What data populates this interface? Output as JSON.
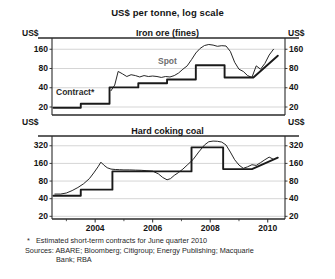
{
  "figure": {
    "title": "US$ per tonne, log scale",
    "unit_label": "US$",
    "footnote_marker": "*",
    "footnote_text": "Estimated short-term contracts for June quarter 2010",
    "sources_label": "Sources:",
    "sources_text": "ABARE; Bloomberg; Citigroup; Energy Publishing; Macquarie",
    "sources_text_cont": "Bank; RBA",
    "line_color": "#1a1a1a",
    "grid_color": "#b9b9b9",
    "frame_color": "#2a2a2a",
    "background": "#ffffff"
  },
  "chart_data": [
    {
      "type": "line",
      "title": "Iron ore (fines)",
      "xlabel": "",
      "ylabel": "US$",
      "yscale": "log",
      "ylim": [
        15,
        240
      ],
      "yticks": [
        20,
        40,
        80,
        160
      ],
      "ytick_labels": [
        "20",
        "40",
        "80",
        "160"
      ],
      "xlim": [
        2002.5,
        2010.6
      ],
      "xticks": [
        2004,
        2006,
        2008,
        2010
      ],
      "xtick_labels": [
        "2004",
        "2006",
        "2008",
        "2010"
      ],
      "xminor": [
        2003,
        2005,
        2007,
        2009
      ],
      "grid": true,
      "legend_position": "in-plot",
      "series": [
        {
          "name": "Contract*",
          "style": "step",
          "width": 1.9,
          "label_x": 2003.25,
          "label_y": 31,
          "x": [
            2002.55,
            2003.5,
            2003.5,
            2004.5,
            2004.5,
            2005.5,
            2005.5,
            2006.5,
            2006.5,
            2007.5,
            2007.5,
            2008.5,
            2008.5,
            2009.5,
            2009.5,
            2010.35
          ],
          "values": [
            19.5,
            19.5,
            22.5,
            22.5,
            40.5,
            40.5,
            47,
            47,
            54,
            54,
            90,
            90,
            58,
            58,
            58,
            127
          ]
        },
        {
          "name": "Spot",
          "style": "line",
          "width": 0.95,
          "label_x": 2006.2,
          "label_y": 108,
          "x": [
            2004.55,
            2004.68,
            2004.8,
            2004.95,
            2005.1,
            2005.25,
            2005.4,
            2005.55,
            2005.7,
            2005.85,
            2006.0,
            2006.15,
            2006.3,
            2006.45,
            2006.6,
            2006.75,
            2006.9,
            2007.05,
            2007.2,
            2007.35,
            2007.5,
            2007.65,
            2007.8,
            2007.95,
            2008.1,
            2008.25,
            2008.4,
            2008.55,
            2008.7,
            2008.85,
            2009.0,
            2009.15,
            2009.3,
            2009.45,
            2009.6,
            2009.75,
            2009.9,
            2010.05,
            2010.2
          ],
          "values": [
            36,
            44,
            72,
            66,
            60,
            64,
            62,
            59,
            62,
            60,
            61,
            60,
            58,
            60,
            59,
            62,
            68,
            78,
            88,
            110,
            140,
            165,
            183,
            190,
            186,
            178,
            182,
            180,
            148,
            100,
            78,
            72,
            62,
            58,
            88,
            78,
            96,
            130,
            160
          ]
        }
      ]
    },
    {
      "type": "line",
      "title": "Hard coking coal",
      "xlabel": "",
      "ylabel": "US$",
      "yscale": "log",
      "ylim": [
        18,
        470
      ],
      "yticks": [
        20,
        40,
        80,
        160,
        320
      ],
      "ytick_labels": [
        "20",
        "40",
        "80",
        "160",
        "320"
      ],
      "xlim": [
        2002.5,
        2010.6
      ],
      "xticks": [
        2004,
        2006,
        2008,
        2010
      ],
      "xtick_labels": [
        "2004",
        "2006",
        "2008",
        "2010"
      ],
      "xminor": [
        2003,
        2005,
        2007,
        2009
      ],
      "grid": true,
      "legend_position": "none",
      "series": [
        {
          "name": "Contract",
          "style": "step",
          "width": 1.9,
          "x": [
            2002.55,
            2003.5,
            2003.5,
            2004.6,
            2004.6,
            2007.35,
            2007.35,
            2008.45,
            2008.45,
            2009.45,
            2009.45,
            2010.35
          ],
          "values": [
            45,
            45,
            57,
            57,
            117,
            117,
            300,
            300,
            128,
            128,
            128,
            200
          ]
        },
        {
          "name": "Spot",
          "style": "line",
          "width": 0.95,
          "x": [
            2002.6,
            2002.8,
            2003.0,
            2003.2,
            2003.4,
            2003.6,
            2003.8,
            2003.95,
            2004.1,
            2004.2,
            2004.3,
            2004.42,
            2004.55,
            2004.7,
            2004.85,
            2005.0,
            2005.2,
            2005.4,
            2005.6,
            2005.8,
            2006.0,
            2006.2,
            2006.35,
            2006.5,
            2006.62,
            2006.75,
            2006.9,
            2007.05,
            2007.2,
            2007.4,
            2007.6,
            2007.8,
            2007.95,
            2008.1,
            2008.25,
            2008.4,
            2008.55,
            2008.7,
            2008.85,
            2009.0,
            2009.15,
            2009.3,
            2009.45,
            2009.6,
            2009.75,
            2009.9,
            2010.05,
            2010.2
          ],
          "values": [
            48,
            48,
            50,
            55,
            62,
            72,
            88,
            110,
            140,
            168,
            150,
            135,
            128,
            126,
            125,
            124,
            124,
            123,
            122,
            120,
            118,
            106,
            92,
            84,
            88,
            100,
            112,
            128,
            150,
            185,
            250,
            330,
            375,
            385,
            382,
            370,
            330,
            250,
            185,
            150,
            132,
            140,
            152,
            148,
            165,
            185,
            205,
            188
          ]
        }
      ]
    }
  ]
}
